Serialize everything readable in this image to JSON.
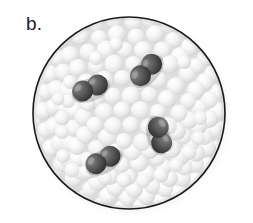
{
  "figure": {
    "panel_label": "b.",
    "caption_text": "",
    "type": "molecular-model-diagram"
  },
  "colors": {
    "background": "#ffffff",
    "circle_outline": "#1a1a1a",
    "solvent_sphere_light": "#ffffff",
    "solvent_sphere_mid": "#efefef",
    "solvent_sphere_shade": "#d2d2d2",
    "solute_dark": "#4d4d4d",
    "solute_dark_shadow": "#2b2b2b",
    "solute_highlight": "#8e8e8e",
    "label_text": "#1c1c1c"
  },
  "circle": {
    "center_x": 129,
    "center_y": 113,
    "radius": 96,
    "stroke_width": 1.6
  },
  "chart_data": {
    "type": "scatter",
    "title": "b.",
    "xlabel": "",
    "ylabel": "",
    "solvent_particle_count": 230,
    "solute_molecule_count": 4,
    "solvent_radius_range": [
      6,
      10
    ],
    "solute_sphere_radius": 10.5,
    "solute_molecules": [
      {
        "id": "molecule-1",
        "cx": 90,
        "cy": 88,
        "angle": -22,
        "bond_length": 16
      },
      {
        "id": "molecule-2",
        "cx": 146,
        "cy": 70,
        "angle": -46,
        "bond_length": 16
      },
      {
        "id": "molecule-3",
        "cx": 160,
        "cy": 135,
        "angle": 78,
        "bond_length": 16
      },
      {
        "id": "molecule-4",
        "cx": 103,
        "cy": 160,
        "angle": -28,
        "bond_length": 16
      }
    ]
  }
}
